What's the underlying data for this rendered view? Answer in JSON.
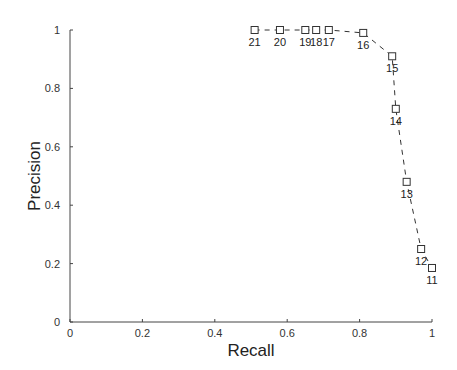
{
  "chart_data": {
    "type": "line",
    "title": "",
    "xlabel": "Recall",
    "ylabel": "Precision",
    "xlim": [
      0,
      1
    ],
    "ylim": [
      0,
      1
    ],
    "grid": false,
    "legend": null,
    "x_ticks": [
      "0",
      "0.2",
      "0.4",
      "0.6",
      "0.8",
      "1"
    ],
    "y_ticks": [
      "0",
      "0.2",
      "0.4",
      "0.6",
      "0.8",
      "1"
    ],
    "line_style": "dashed",
    "marker": "square",
    "series": [
      {
        "name": "precision-recall",
        "points": [
          {
            "label": "21",
            "x": 0.51,
            "y": 1.0
          },
          {
            "label": "20",
            "x": 0.58,
            "y": 1.0
          },
          {
            "label": "19",
            "x": 0.65,
            "y": 1.0
          },
          {
            "label": "18",
            "x": 0.68,
            "y": 1.0
          },
          {
            "label": "17",
            "x": 0.715,
            "y": 1.0
          },
          {
            "label": "16",
            "x": 0.81,
            "y": 0.99
          },
          {
            "label": "15",
            "x": 0.89,
            "y": 0.91
          },
          {
            "label": "14",
            "x": 0.9,
            "y": 0.73
          },
          {
            "label": "13",
            "x": 0.93,
            "y": 0.48
          },
          {
            "label": "12",
            "x": 0.97,
            "y": 0.25
          },
          {
            "label": "11",
            "x": 1.0,
            "y": 0.185
          }
        ]
      }
    ],
    "colors": {
      "line": "#333333",
      "marker": "#333333",
      "axis": "#444444"
    }
  }
}
